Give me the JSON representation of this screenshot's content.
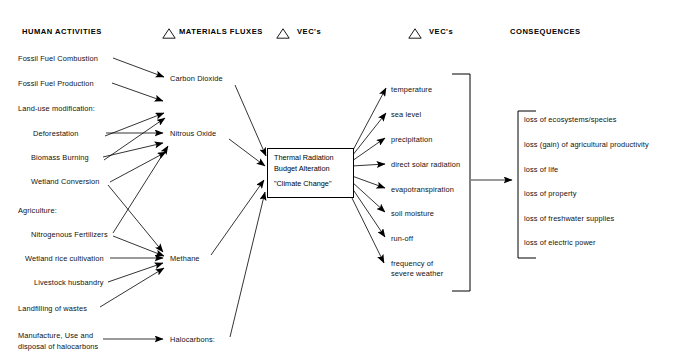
{
  "diagram": {
    "title_row": {
      "human_activities": "HUMAN ACTIVITIES",
      "materials_fluxes": "MATERIALS FLUXES",
      "vec_1": "VEC's",
      "vec_2": "VEC's",
      "consequences": "CONSEQUENCES"
    },
    "human_activities": [
      {
        "label": "Fossil Fuel Combustion",
        "x": 18,
        "y": 60
      },
      {
        "label": "Fossil Fuel Production",
        "x": 18,
        "y": 85
      },
      {
        "label": "Land-use modification:",
        "x": 18,
        "y": 110
      },
      {
        "label": "Deforestation",
        "x": 33,
        "y": 135
      },
      {
        "label": "Biomass Burning",
        "x": 31,
        "y": 159
      },
      {
        "label": "Wetland Conversion",
        "x": 31,
        "y": 183
      },
      {
        "label": "Agriculture:",
        "x": 18,
        "y": 211
      },
      {
        "label": "Nitrogenous Fertilizers",
        "x": 31,
        "y": 236
      },
      {
        "label": "Wetland rice cultivation",
        "x": 25,
        "y": 260
      },
      {
        "label": "Livestock husbandry",
        "x": 34,
        "y": 284
      },
      {
        "label": "Landfilling of wastes",
        "x": 18,
        "y": 310
      },
      {
        "label": "Manufacture, Use and",
        "x": 18,
        "y": 337
      },
      {
        "label": "disposal of halocarbons",
        "x": 18,
        "y": 348
      }
    ],
    "materials_fluxes": [
      {
        "label": "Carbon Dioxide",
        "x": 170,
        "y": 80
      },
      {
        "label": "Nitrous Oxide",
        "x": 170,
        "y": 135
      },
      {
        "label": "Methane",
        "x": 170,
        "y": 260
      },
      {
        "label": "Halocarbons:",
        "x": 170,
        "y": 341
      }
    ],
    "center_box": {
      "line1": "Thermal Radiation",
      "line2": "Budget Alteration",
      "line3": "\"Climate Change\""
    },
    "vec_items": [
      {
        "label": "temperature",
        "y": 90
      },
      {
        "label": "sea level",
        "y": 115
      },
      {
        "label": "precipitation",
        "y": 140
      },
      {
        "label": "direct solar radiation",
        "y": 165
      },
      {
        "label": "evapotranspiration",
        "y": 190
      },
      {
        "label": "soil moisture",
        "y": 214
      },
      {
        "label": "run-off",
        "y": 239
      },
      {
        "label": "frequency of",
        "y": 264
      },
      {
        "label": "severe weather",
        "y": 274
      }
    ],
    "consequences": [
      {
        "label": "loss of ecosystems/species",
        "y": 120
      },
      {
        "label": "loss (gain) of agricultural productivity",
        "y": 145
      },
      {
        "label": "loss of life",
        "y": 170
      },
      {
        "label": "loss of property",
        "y": 194
      },
      {
        "label": "loss of freshwater supplies",
        "y": 219
      },
      {
        "label": "loss of electric power",
        "y": 243
      }
    ],
    "colors": {
      "ink": "#000000",
      "background": "#ffffff"
    }
  }
}
